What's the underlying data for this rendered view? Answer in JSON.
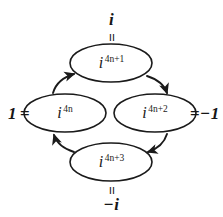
{
  "diagram": {
    "background_color": "#ffffff",
    "stroke_color": "#1a1a1a",
    "nodes": [
      {
        "id": "top",
        "base": "i",
        "exponent": "4n+1",
        "equals_sign": "=",
        "value_label": "i",
        "value_position": "above"
      },
      {
        "id": "left",
        "base": "i",
        "exponent": "4n",
        "equals_sign": "=",
        "value_label": "1",
        "value_position": "left"
      },
      {
        "id": "right",
        "base": "i",
        "exponent": "4n+2",
        "equals_sign": "=",
        "value_label": "−1",
        "value_position": "right"
      },
      {
        "id": "bottom",
        "base": "i",
        "exponent": "4n+3",
        "equals_sign": "=",
        "value_label": "−i",
        "value_position": "below"
      }
    ],
    "arrows": [
      {
        "id": "left-to-top",
        "from": "left",
        "to": "top",
        "direction": "counterclockwise"
      },
      {
        "id": "top-to-right",
        "from": "top",
        "to": "right",
        "direction": "counterclockwise"
      },
      {
        "id": "right-to-bottom",
        "from": "right",
        "to": "bottom",
        "direction": "counterclockwise"
      },
      {
        "id": "bottom-to-left",
        "from": "bottom",
        "to": "left",
        "direction": "counterclockwise"
      }
    ]
  }
}
